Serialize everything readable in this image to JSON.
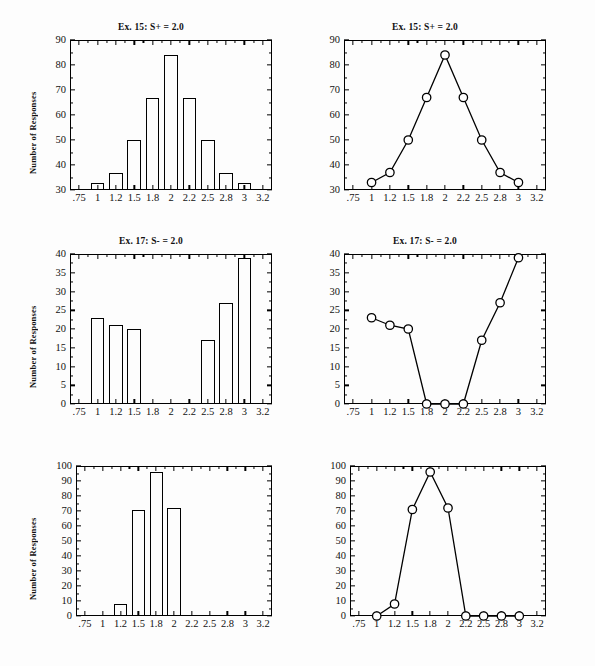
{
  "figure": {
    "clipped_top_text": "",
    "y_axis_label": "Number of Responses",
    "x_categories": [
      ".75",
      "1",
      "1.2",
      "1.5",
      "1.8",
      "2",
      "2.2",
      "2.5",
      "2.8",
      "3",
      "3.2"
    ],
    "data_x": [
      "1",
      "1.2",
      "1.5",
      "1.8",
      "2",
      "2.2",
      "2.5",
      "2.8",
      "3"
    ]
  },
  "chart_data": [
    {
      "type": "bar",
      "panel": "row1-left",
      "title": "Ex. 15: S+ = 2.0",
      "xlabel": "",
      "ylabel": "Number of Responses",
      "categories": [
        "1",
        "1.2",
        "1.5",
        "1.8",
        "2",
        "2.2",
        "2.5",
        "2.8",
        "3"
      ],
      "values": [
        33,
        37,
        50,
        67,
        84,
        67,
        50,
        37,
        33
      ],
      "axis_categories": [
        ".75",
        "1",
        "1.2",
        "1.5",
        "1.8",
        "2",
        "2.2",
        "2.5",
        "2.8",
        "3",
        "3.2"
      ],
      "yticks": [
        30,
        40,
        50,
        60,
        70,
        80,
        90
      ],
      "ylim": [
        30,
        90
      ],
      "grid": false,
      "legend": "none"
    },
    {
      "type": "line",
      "panel": "row1-right",
      "title": "Ex. 15: S+ = 2.0",
      "xlabel": "",
      "ylabel": "",
      "categories": [
        "1",
        "1.2",
        "1.5",
        "1.8",
        "2",
        "2.2",
        "2.5",
        "2.8",
        "3"
      ],
      "values": [
        33,
        37,
        50,
        67,
        84,
        67,
        50,
        37,
        33
      ],
      "axis_categories": [
        ".75",
        "1",
        "1.2",
        "1.5",
        "1.8",
        "2",
        "2.2",
        "2.5",
        "2.8",
        "3",
        "3.2"
      ],
      "yticks": [
        30,
        40,
        50,
        60,
        70,
        80,
        90
      ],
      "ylim": [
        30,
        90
      ],
      "marker": "open-circle",
      "grid": false,
      "legend": "none"
    },
    {
      "type": "bar",
      "panel": "row2-left",
      "title": "Ex. 17: S- = 2.0",
      "xlabel": "",
      "ylabel": "Number of Responses",
      "categories": [
        "1",
        "1.2",
        "1.5",
        "1.8",
        "2",
        "2.2",
        "2.5",
        "2.8",
        "3"
      ],
      "values": [
        23,
        21,
        20,
        0,
        0,
        0,
        17,
        27,
        39
      ],
      "axis_categories": [
        ".75",
        "1",
        "1.2",
        "1.5",
        "1.8",
        "2",
        "2.2",
        "2.5",
        "2.8",
        "3",
        "3.2"
      ],
      "yticks": [
        0,
        5,
        10,
        15,
        20,
        25,
        30,
        35,
        40
      ],
      "ylim": [
        0,
        40
      ],
      "grid": false,
      "legend": "none"
    },
    {
      "type": "line",
      "panel": "row2-right",
      "title": "Ex. 17: S- = 2.0",
      "xlabel": "",
      "ylabel": "",
      "categories": [
        "1",
        "1.2",
        "1.5",
        "1.8",
        "2",
        "2.2",
        "2.5",
        "2.8",
        "3"
      ],
      "values": [
        23,
        21,
        20,
        0,
        0,
        0,
        17,
        27,
        39
      ],
      "axis_categories": [
        ".75",
        "1",
        "1.2",
        "1.5",
        "1.8",
        "2",
        "2.2",
        "2.5",
        "2.8",
        "3",
        "3.2"
      ],
      "yticks": [
        0,
        5,
        10,
        15,
        20,
        25,
        30,
        35,
        40
      ],
      "ylim": [
        0,
        40
      ],
      "marker": "open-circle",
      "grid": false,
      "legend": "none"
    },
    {
      "type": "bar",
      "panel": "row3-left",
      "title": "",
      "xlabel": "",
      "ylabel": "Number of Responses",
      "categories": [
        "1",
        "1.2",
        "1.5",
        "1.8",
        "2",
        "2.2",
        "2.5",
        "2.8",
        "3"
      ],
      "values": [
        0,
        8,
        71,
        96,
        72,
        0,
        0,
        0,
        0
      ],
      "axis_categories": [
        ".75",
        "1",
        "1.2",
        "1.5",
        "1.8",
        "2",
        "2.2",
        "2.5",
        "2.8",
        "3",
        "3.2"
      ],
      "yticks": [
        0,
        10,
        20,
        30,
        40,
        50,
        60,
        70,
        80,
        90,
        100
      ],
      "ylim": [
        0,
        100
      ],
      "grid": false,
      "legend": "none"
    },
    {
      "type": "line",
      "panel": "row3-right",
      "title": "",
      "xlabel": "",
      "ylabel": "",
      "categories": [
        "1",
        "1.2",
        "1.5",
        "1.8",
        "2",
        "2.2",
        "2.5",
        "2.8",
        "3"
      ],
      "values": [
        0,
        8,
        71,
        96,
        72,
        0,
        0,
        0,
        0
      ],
      "axis_categories": [
        ".75",
        "1",
        "1.2",
        "1.5",
        "1.8",
        "2",
        "2.2",
        "2.5",
        "2.8",
        "3",
        "3.2"
      ],
      "yticks": [
        0,
        10,
        20,
        30,
        40,
        50,
        60,
        70,
        80,
        90,
        100
      ],
      "ylim": [
        0,
        100
      ],
      "marker": "open-circle",
      "grid": false,
      "legend": "none"
    }
  ]
}
